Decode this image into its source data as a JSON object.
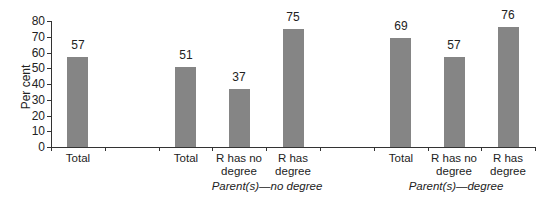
{
  "chart_data": {
    "type": "bar",
    "title": "",
    "xlabel": "",
    "ylabel": "Per cent",
    "ylim": [
      0,
      80
    ],
    "yticks": [
      0,
      10,
      20,
      30,
      40,
      50,
      60,
      70,
      80
    ],
    "grid": false,
    "legend": null,
    "categories": [
      "Total",
      "",
      "Total",
      "R has no degree",
      "R has degree",
      "",
      "Total",
      "R has no degree",
      "R has degree"
    ],
    "values": [
      57,
      null,
      51,
      37,
      75,
      null,
      69,
      57,
      76
    ],
    "groups": [
      {
        "label": "",
        "categories": [
          "Total"
        ],
        "values": [
          57
        ]
      },
      {
        "label": "Parent(s)—no degree",
        "categories": [
          "Total",
          "R has no degree",
          "R has degree"
        ],
        "values": [
          51,
          37,
          75
        ]
      },
      {
        "label": "Parent(s)—degree",
        "categories": [
          "Total",
          "R has no degree",
          "R has degree"
        ],
        "values": [
          69,
          57,
          76
        ]
      }
    ],
    "bar_color": "#858585",
    "data_labels": true
  },
  "labels": {
    "ylabel": "Per cent",
    "group_no_degree": "Parent(s)—no degree",
    "group_degree": "Parent(s)—degree"
  }
}
